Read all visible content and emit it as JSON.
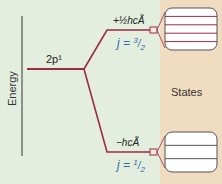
{
  "axis": {
    "label": "Energy"
  },
  "level": {
    "label": "2p¹"
  },
  "upper": {
    "energy": "+½hcÃ",
    "j_prefix": "j = ",
    "j_num": "3",
    "j_den": "2",
    "states": 4
  },
  "lower": {
    "energy": "−hcÃ",
    "j_prefix": "j = ",
    "j_num": "1",
    "j_den": "2",
    "states": 2
  },
  "states_label": "States",
  "colors": {
    "background": "#e4eedf",
    "band": "#f0dcc0",
    "line": "#9c2a4a",
    "jtext": "#2a6aa8",
    "axis": "#333333"
  }
}
